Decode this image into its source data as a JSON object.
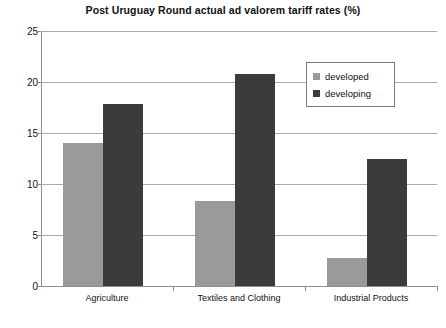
{
  "chart_data": {
    "type": "bar",
    "title": "Post Uruguay Round actual ad valorem tariff rates (%)",
    "xlabel": "",
    "ylabel": "",
    "categories": [
      "Agriculture",
      "Textiles and Clothing",
      "Industrial Products"
    ],
    "series": [
      {
        "name": "developed",
        "values": [
          14.0,
          8.3,
          2.7
        ],
        "color": "#9a9a9a"
      },
      {
        "name": "developing",
        "values": [
          17.8,
          20.8,
          12.5
        ],
        "color": "#3b3b3b"
      }
    ],
    "ylim": [
      0,
      25
    ],
    "ytick_values": [
      0,
      5,
      10,
      15,
      20,
      25
    ],
    "ytick_labels": [
      "0",
      "5",
      "10",
      "15",
      "20",
      "25"
    ],
    "grid": true,
    "legend_position": "upper right"
  },
  "legend": {
    "entries": [
      {
        "label": "developed"
      },
      {
        "label": "developing"
      }
    ]
  },
  "footer": {
    "note": ""
  }
}
